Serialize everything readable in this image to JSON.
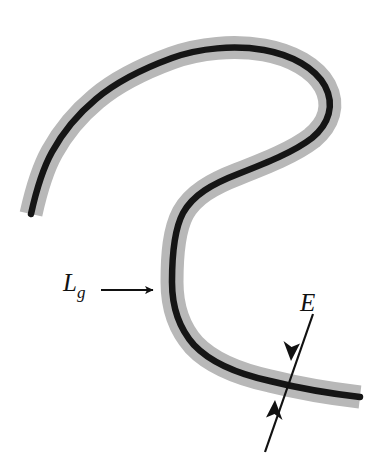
{
  "figure": {
    "background_color": "#ffffff",
    "width": 384,
    "height": 468,
    "band": {
      "name": "grey-cladding-band",
      "color": "#b8b8b8",
      "stroke_width": 23,
      "description": "Thick grey S-shaped band (cladding / guide region)"
    },
    "core_line": {
      "name": "black-core-line",
      "color": "#151515",
      "stroke_width": 6.5,
      "description": "Black centerline running down the middle of the grey band"
    },
    "path_points": [
      [
        31,
        214
      ],
      [
        38,
        186
      ],
      [
        50,
        156
      ],
      [
        66,
        130
      ],
      [
        86,
        107
      ],
      [
        112,
        86
      ],
      [
        142,
        69
      ],
      [
        175,
        56
      ],
      [
        210,
        49
      ],
      [
        246,
        48
      ],
      [
        281,
        54
      ],
      [
        309,
        68
      ],
      [
        326,
        88
      ],
      [
        329,
        110
      ],
      [
        316,
        131
      ],
      [
        292,
        149
      ],
      [
        258,
        165
      ],
      [
        222,
        181
      ],
      [
        196,
        198
      ],
      [
        180,
        222
      ],
      [
        173,
        252
      ],
      [
        173,
        285
      ],
      [
        180,
        315
      ],
      [
        198,
        342
      ],
      [
        226,
        362
      ],
      [
        262,
        376
      ],
      [
        302,
        387
      ],
      [
        340,
        394
      ],
      [
        360,
        397
      ]
    ]
  },
  "annotations": {
    "lg": {
      "label": "L",
      "subscript": "g",
      "name": "label-lg",
      "arrow": {
        "name": "lg-arrow",
        "color": "#111111",
        "from": [
          101,
          290
        ],
        "to": [
          160,
          290
        ],
        "head": "single",
        "head_direction": "right"
      },
      "description": "Arrow pointing at the outer left edge of the band, labelling the guide length/position L sub g"
    },
    "e": {
      "label": "E",
      "name": "label-e",
      "arrow": {
        "name": "e-double-arrow",
        "color": "#111111",
        "from": [
          312,
          316
        ],
        "to": [
          265,
          452
        ],
        "head": "double",
        "head_positions": [
          [
            291,
            357
          ],
          [
            274,
            405
          ]
        ],
        "description": "Double-headed arrow crossing the band, measuring its width E"
      }
    }
  },
  "colors": {
    "band_grey": "#b8b8b8",
    "core_black": "#151515",
    "annotation_black": "#111111",
    "background_white": "#ffffff"
  }
}
